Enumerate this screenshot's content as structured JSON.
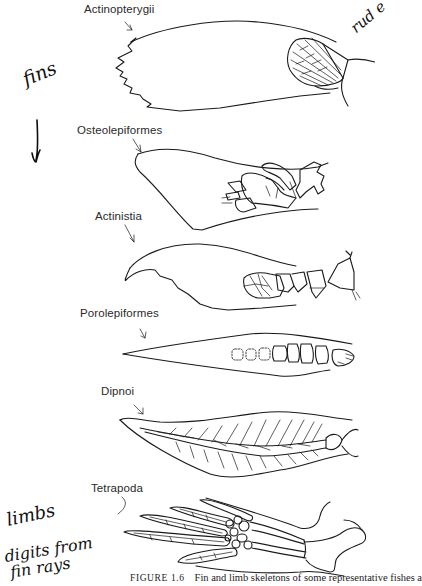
{
  "figure": {
    "caption_number": "FIGURE 1.6",
    "caption_text": "Fin and limb skeletons of some representative fishes a",
    "taxa": [
      {
        "name": "Actinopterygii",
        "structure": "fin"
      },
      {
        "name": "Osteolepiformes",
        "structure": "fin"
      },
      {
        "name": "Actinistia",
        "structure": "fin"
      },
      {
        "name": "Porolepiformes",
        "structure": "fin"
      },
      {
        "name": "Dipnoi",
        "structure": "fin"
      },
      {
        "name": "Tetrapoda",
        "structure": "limb"
      }
    ]
  },
  "annotations": {
    "fins": "fins",
    "limbs": "limbs",
    "digits_line1": "digits from",
    "digits_line2": "fin rays",
    "corner_partial": "rud e"
  }
}
